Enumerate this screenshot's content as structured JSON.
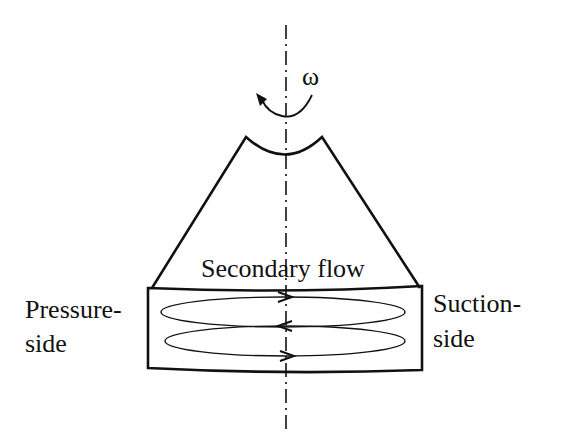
{
  "diagram": {
    "rotation_symbol": "ω",
    "labels": {
      "secondary_flow": "Secondary flow",
      "pressure_side_line1": "Pressure-",
      "pressure_side_line2": "side",
      "suction_side_line1": "Suction-",
      "suction_side_line2": "side"
    },
    "flow_arrows": [
      {
        "position": "top",
        "direction": "right"
      },
      {
        "position": "middle",
        "direction": "left"
      },
      {
        "position": "bottom",
        "direction": "right"
      }
    ],
    "colors": {
      "stroke": "#111111",
      "background": "#ffffff"
    }
  }
}
